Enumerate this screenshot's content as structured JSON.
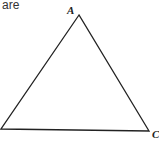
{
  "text": {
    "leading_word": "are"
  },
  "diagram": {
    "type": "triangle",
    "vertices": [
      {
        "label": "A",
        "x": 79,
        "y": 15
      },
      {
        "label": "",
        "x": 1,
        "y": 129
      },
      {
        "label": "C",
        "x": 149,
        "y": 131
      }
    ],
    "stroke_color": "#222222"
  }
}
